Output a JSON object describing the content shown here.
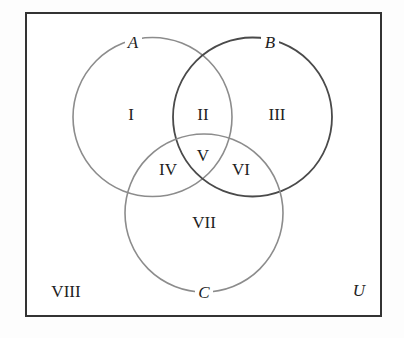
{
  "diagram": {
    "type": "venn",
    "universe": {
      "label": "U",
      "box": {
        "x": 26,
        "y": 13,
        "width": 355,
        "height": 303
      },
      "border_color": "#333333"
    },
    "sets": [
      {
        "id": "A",
        "label": "A",
        "cx": 152.5,
        "cy": 117,
        "r": 79.5,
        "stroke": "#8c8c8c",
        "label_x": 133,
        "label_y": 48
      },
      {
        "id": "B",
        "label": "B",
        "cx": 252.5,
        "cy": 117,
        "r": 79.5,
        "stroke": "#4a4a4a",
        "label_x": 270,
        "label_y": 48
      },
      {
        "id": "C",
        "label": "C",
        "cx": 204,
        "cy": 213,
        "r": 79,
        "stroke": "#8c8c8c",
        "label_x": 204,
        "label_y": 298
      }
    ],
    "regions": [
      {
        "id": "I",
        "label": "I",
        "description": "A only",
        "x": 131,
        "y": 120
      },
      {
        "id": "II",
        "label": "II",
        "description": "A and B, not C",
        "x": 203,
        "y": 120
      },
      {
        "id": "III",
        "label": "III",
        "description": "B only",
        "x": 277,
        "y": 120
      },
      {
        "id": "IV",
        "label": "IV",
        "description": "A and C, not B",
        "x": 168,
        "y": 175
      },
      {
        "id": "V",
        "label": "V",
        "description": "A and B and C",
        "x": 203,
        "y": 161
      },
      {
        "id": "VI",
        "label": "VI",
        "description": "B and C, not A",
        "x": 241,
        "y": 175
      },
      {
        "id": "VII",
        "label": "VII",
        "description": "C only",
        "x": 204,
        "y": 228
      },
      {
        "id": "VIII",
        "label": "VIII",
        "description": "outside A, B, C",
        "x": 66,
        "y": 297
      }
    ],
    "universe_label_pos": {
      "x": 359,
      "y": 296
    }
  }
}
